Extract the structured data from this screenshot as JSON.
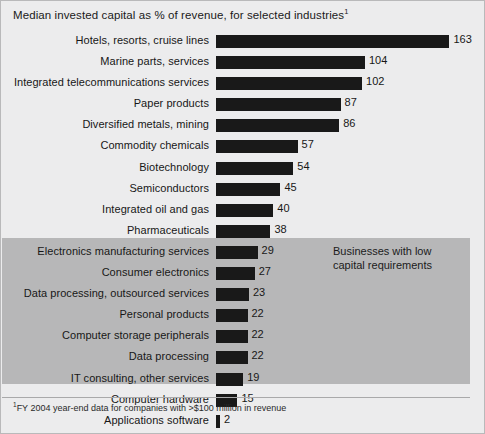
{
  "chart_data": {
    "type": "bar",
    "orientation": "horizontal",
    "title": "Median invested capital as % of revenue, for selected industries",
    "title_superscript": "1",
    "xlabel": "",
    "ylabel": "",
    "grid": false,
    "legend": "none",
    "xlim": [
      -10,
      170
    ],
    "zero_baseline": true,
    "bar_color": "#191919",
    "categories": [
      "Hotels, resorts, cruise lines",
      "Marine parts, services",
      "Integrated telecommunications services",
      "Paper products",
      "Diversified metals, mining",
      "Commodity chemicals",
      "Biotechnology",
      "Semiconductors",
      "Integrated oil and gas",
      "Pharmaceuticals",
      "Electronics manufacturing services",
      "Consumer electronics",
      "Data processing, outsourced services",
      "Personal products",
      "Computer storage peripherals",
      "Data processing",
      "IT consulting, other services",
      "Computer hardware",
      "Applications software",
      "System software"
    ],
    "values": [
      163,
      104,
      102,
      87,
      86,
      57,
      54,
      45,
      40,
      38,
      29,
      27,
      23,
      22,
      22,
      22,
      19,
      15,
      2,
      -3
    ],
    "value_labels": [
      "163",
      "104",
      "102",
      "87",
      "86",
      "57",
      "54",
      "45",
      "40",
      "38",
      "29",
      "27",
      "23",
      "22",
      "22",
      "22",
      "19",
      "15",
      "2",
      "–3"
    ],
    "annotations": [
      {
        "text_line_1": "Businesses with low",
        "text_line_2": "capital requirements",
        "highlight_from_category": "Data processing, outsourced services",
        "highlight_to_category": "System software",
        "highlight_color": "#b7b7b8"
      }
    ],
    "footnote": "FY 2004 year-end data for companies with >$100 million in revenue",
    "footnote_marker": "1"
  },
  "page": {
    "background_color": "#ececed",
    "border_color": "#b9b9ba",
    "text_color": "#1a1a1a"
  }
}
